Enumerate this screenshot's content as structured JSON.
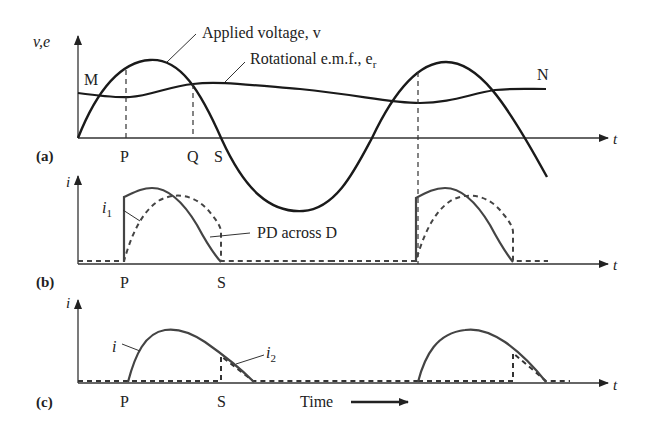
{
  "panels": {
    "a": {
      "tag": "(a)",
      "y_axis_label": "v,e",
      "x_axis_label": "t",
      "curve_labels": {
        "applied_voltage": "Applied voltage, v",
        "rotational_emf_prefix": "Rotational e.m.f., e",
        "rotational_emf_sub": "r"
      },
      "point_labels": {
        "M": "M",
        "N": "N",
        "P": "P",
        "Q": "Q",
        "S": "S"
      }
    },
    "b": {
      "tag": "(b)",
      "y_axis_label": "i",
      "x_axis_label": "t",
      "curve_labels": {
        "i1_main": "i",
        "i1_sub": "1",
        "pd": "PD across D"
      },
      "point_labels": {
        "P": "P",
        "S": "S"
      }
    },
    "c": {
      "tag": "(c)",
      "y_axis_label": "i",
      "x_axis_label": "t",
      "curve_labels": {
        "i": "i",
        "i2_main": "i",
        "i2_sub": "2"
      },
      "point_labels": {
        "P": "P",
        "S": "S"
      },
      "time_label": "Time"
    }
  },
  "colors": {
    "curve": "#1a1a1a",
    "axis": "#333333",
    "background": "#ffffff"
  }
}
